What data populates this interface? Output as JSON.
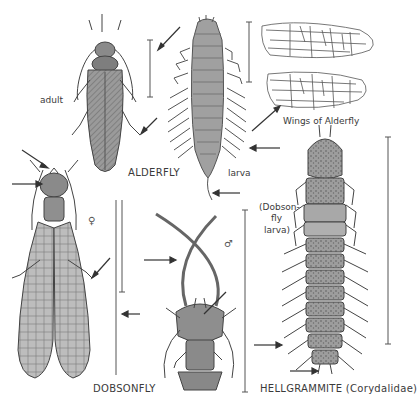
{
  "plate": {
    "subject": "Alderflies and Dobsonflies",
    "figures": [
      {
        "id": "alderfly-adult",
        "caption": "ALDERFLY",
        "sublabel": "adult"
      },
      {
        "id": "alderfly-larva",
        "sublabel": "larva"
      },
      {
        "id": "alderfly-wings",
        "caption": "Wings of Alderfly"
      },
      {
        "id": "dobsonfly-female",
        "caption": "DOBSONFLY",
        "sex_symbol": "♀"
      },
      {
        "id": "dobsonfly-male-head",
        "sex_symbol": "♂"
      },
      {
        "id": "hellgrammite",
        "caption": "HELLGRAMMITE (Corydalidae)",
        "note_lines": [
          "(Dobson-",
          "fly",
          "larva)"
        ]
      }
    ]
  },
  "labels": {
    "adult": "adult",
    "alderfly": "ALDERFLY",
    "larva": "larva",
    "wings": "Wings of Alderfly",
    "female": "♀",
    "male": "♂",
    "dobsonfly": "DOBSONFLY",
    "dobson_note_1": "(Dobson-",
    "dobson_note_2": "fly",
    "dobson_note_3": "larva)",
    "hellgrammite": "HELLGRAMMITE (Corydalidae)"
  },
  "colors": {
    "ink": "#3a3a3a",
    "body_fill": "#8c8c8c",
    "wing_fill": "#b5b5b5",
    "background": "#ffffff"
  }
}
